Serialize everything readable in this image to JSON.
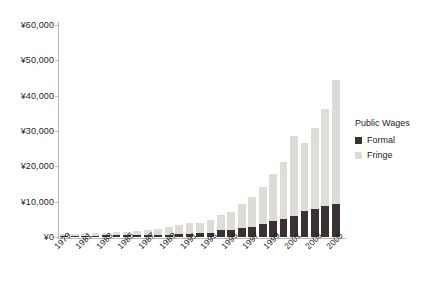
{
  "chart_data": {
    "type": "bar",
    "subtype": "stacked-bar",
    "title": "",
    "xlabel": "",
    "ylabel": "",
    "ylim": [
      0,
      60000
    ],
    "grid": false,
    "currency_symbol": "¥",
    "legend_position": "right",
    "legend_title": "Public Wages",
    "categories": [
      "1979",
      "1980",
      "1981",
      "1982",
      "1983",
      "1984",
      "1985",
      "1986",
      "1987",
      "1988",
      "1989",
      "1990",
      "1991",
      "1992",
      "1993",
      "1994",
      "1995",
      "1996",
      "1997",
      "1998",
      "1999",
      "2000",
      "2001",
      "2002",
      "2003",
      "2004",
      "2005"
    ],
    "x_tick_labels": [
      "1979",
      "1981",
      "1983",
      "1985",
      "1987",
      "1989",
      "1991",
      "1993",
      "1995",
      "1997",
      "1999",
      "2001",
      "2003",
      "2005"
    ],
    "y_tick_labels": [
      "¥0",
      "¥10,000",
      "¥20,000",
      "¥30,000",
      "¥40,000",
      "¥50,000",
      "¥60,000"
    ],
    "y_tick_values": [
      0,
      10000,
      20000,
      30000,
      40000,
      50000,
      60000
    ],
    "series": [
      {
        "name": "Formal",
        "color": "#3a3230",
        "values": [
          300,
          330,
          360,
          400,
          450,
          500,
          560,
          620,
          640,
          660,
          700,
          780,
          900,
          1000,
          1100,
          1900,
          2000,
          2600,
          2750,
          3800,
          4400,
          5100,
          6000,
          7400,
          7900,
          8700,
          9400
        ]
      },
      {
        "name": "Fringe",
        "color": "#dddcd7",
        "values": [
          600,
          640,
          690,
          750,
          830,
          900,
          1000,
          1180,
          1400,
          1600,
          2000,
          2650,
          2950,
          3100,
          3850,
          4400,
          5200,
          6700,
          8500,
          10300,
          13300,
          16200,
          22500,
          19200,
          22900,
          27500,
          35100
        ]
      }
    ],
    "totals": [
      900,
      970,
      1050,
      1150,
      1280,
      1400,
      1560,
      1800,
      2040,
      2260,
      2700,
      3430,
      3850,
      4100,
      4950,
      6300,
      7200,
      9300,
      11250,
      14100,
      17700,
      21300,
      28500,
      26600,
      30800,
      36200,
      44500
    ]
  },
  "legend": {
    "title": "Public Wages",
    "items": [
      {
        "label": "Formal",
        "color": "#3a3230"
      },
      {
        "label": "Fringe",
        "color": "#dddcd7"
      }
    ]
  }
}
